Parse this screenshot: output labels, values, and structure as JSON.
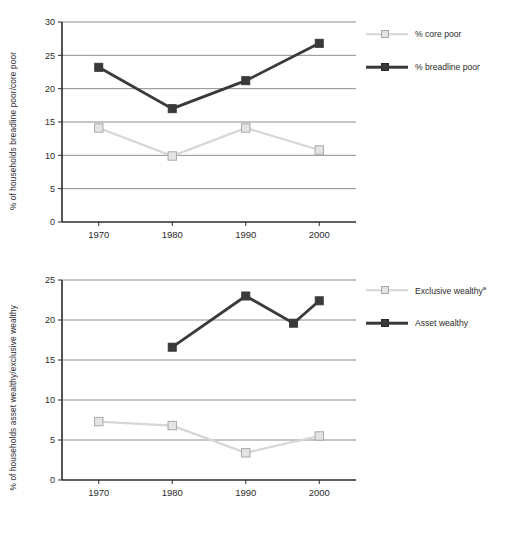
{
  "colors": {
    "light_series": "#d6d6d6",
    "light_marker_fill": "#e4e4e4",
    "light_marker_edge": "#a8a8a8",
    "dark_series": "#3a3a3a",
    "dark_marker_fill": "#3a3a3a",
    "gridline": "#6e6e6e",
    "axis": "#2b2b2b",
    "text": "#2b2b2b",
    "background": "#ffffff"
  },
  "chart_data": [
    {
      "id": "top",
      "type": "line",
      "title": "",
      "xlabel": "",
      "ylabel": "% of households breadline poor/core poor",
      "x": [
        1970,
        1980,
        1990,
        2000
      ],
      "xticklabels": [
        "1970",
        "1980",
        "1990",
        "2000"
      ],
      "xlim": [
        1965,
        2005
      ],
      "ylim": [
        0,
        30
      ],
      "yticks": [
        0,
        5,
        10,
        15,
        20,
        25,
        30
      ],
      "yticklabels": [
        "0",
        "5",
        "10",
        "15",
        "20",
        "25",
        "30"
      ],
      "grid": true,
      "legend_position": "right",
      "series": [
        {
          "name": "% core poor",
          "style": "light",
          "x": [
            1970,
            1980,
            1990,
            2000
          ],
          "values": [
            14.1,
            9.9,
            14.1,
            10.8
          ]
        },
        {
          "name": "% breadline poor",
          "style": "dark",
          "x": [
            1970,
            1980,
            1990,
            2000
          ],
          "values": [
            23.2,
            17.0,
            21.2,
            26.8
          ]
        }
      ]
    },
    {
      "id": "bottom",
      "type": "line",
      "title": "",
      "xlabel": "",
      "ylabel": "% of households asset wealthy/exclusive wealthy",
      "x": [
        1970,
        1980,
        1990,
        2000
      ],
      "xticklabels": [
        "1970",
        "1980",
        "1990",
        "2000"
      ],
      "xlim": [
        1965,
        2005
      ],
      "ylim": [
        0,
        25
      ],
      "yticks": [
        0,
        5,
        10,
        15,
        20,
        25
      ],
      "yticklabels": [
        "0",
        "5",
        "10",
        "15",
        "20",
        "25"
      ],
      "grid": true,
      "legend_position": "right",
      "series": [
        {
          "name": "Exclusive wealthy",
          "name_superscript": "a",
          "style": "light",
          "x": [
            1970,
            1980,
            1990,
            2000
          ],
          "values": [
            7.3,
            6.8,
            3.4,
            5.5
          ]
        },
        {
          "name": "Asset wealthy",
          "style": "dark",
          "x": [
            1980,
            1990,
            1996.5,
            2000
          ],
          "values": [
            16.6,
            23.0,
            19.6,
            22.4
          ]
        }
      ]
    }
  ]
}
